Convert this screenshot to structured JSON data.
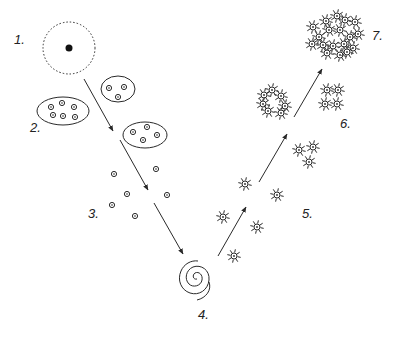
{
  "diagram": {
    "colors": {
      "ink": "#2a2a2a",
      "background": "#ffffff"
    },
    "stages": [
      {
        "label": "1.",
        "x": 14,
        "y": 44,
        "description": "dotted circle with solid nucleus"
      },
      {
        "label": "2.",
        "x": 30,
        "y": 132,
        "description": "clusters of cells in ellipses"
      },
      {
        "label": "3.",
        "x": 88,
        "y": 218,
        "description": "scattered single cells"
      },
      {
        "label": "4.",
        "x": 198,
        "y": 319,
        "description": "spiral"
      },
      {
        "label": "5.",
        "x": 302,
        "y": 218,
        "description": "scattered radiant cells"
      },
      {
        "label": "6.",
        "x": 340,
        "y": 128,
        "description": "small clusters of radiant cells"
      },
      {
        "label": "7.",
        "x": 372,
        "y": 40,
        "description": "large dense cluster of radiant cells"
      }
    ],
    "stage1": {
      "cx": 69,
      "cy": 48,
      "r": 26,
      "nucleus_r": 3.5
    },
    "ellipses": [
      {
        "cx": 63,
        "cy": 111,
        "rx": 26,
        "ry": 14,
        "cells": [
          [
            51,
            107
          ],
          [
            62,
            103
          ],
          [
            74,
            107
          ],
          [
            53,
            115
          ],
          [
            63,
            116
          ],
          [
            75,
            117
          ]
        ]
      },
      {
        "cx": 118,
        "cy": 89,
        "rx": 17,
        "ry": 13,
        "cells": [
          [
            109,
            88
          ],
          [
            124,
            87
          ],
          [
            118,
            97
          ]
        ]
      },
      {
        "cx": 145,
        "cy": 135,
        "rx": 22,
        "ry": 13,
        "cells": [
          [
            133,
            132
          ],
          [
            147,
            127
          ],
          [
            157,
            135
          ],
          [
            143,
            140
          ]
        ]
      }
    ],
    "stage3_cells": [
      [
        114,
        174
      ],
      [
        156,
        169
      ],
      [
        127,
        194
      ],
      [
        112,
        205
      ],
      [
        135,
        216
      ],
      [
        167,
        195
      ]
    ],
    "stage5_stars": [
      [
        223,
        217
      ],
      [
        234,
        256
      ],
      [
        257,
        227
      ],
      [
        245,
        184
      ],
      [
        277,
        195
      ],
      [
        299,
        150
      ],
      [
        313,
        147
      ],
      [
        309,
        162
      ]
    ],
    "stage6_stars": [
      [
        264,
        95
      ],
      [
        272,
        90
      ],
      [
        281,
        96
      ],
      [
        285,
        106
      ],
      [
        263,
        104
      ],
      [
        268,
        111
      ],
      [
        281,
        113
      ],
      [
        327,
        90
      ],
      [
        338,
        90
      ],
      [
        325,
        104
      ],
      [
        337,
        104
      ]
    ],
    "stage7_stars": [
      [
        313,
        27
      ],
      [
        326,
        21
      ],
      [
        337,
        16
      ],
      [
        345,
        20
      ],
      [
        355,
        22
      ],
      [
        358,
        34
      ],
      [
        350,
        37
      ],
      [
        340,
        30
      ],
      [
        329,
        30
      ],
      [
        319,
        37
      ],
      [
        312,
        44
      ],
      [
        323,
        45
      ],
      [
        333,
        46
      ],
      [
        344,
        44
      ],
      [
        353,
        48
      ],
      [
        327,
        53
      ],
      [
        340,
        55
      ],
      [
        347,
        52
      ]
    ],
    "arrows": [
      {
        "x1": 84,
        "y1": 79,
        "x2": 113,
        "y2": 131
      },
      {
        "x1": 120,
        "y1": 140,
        "x2": 148,
        "y2": 190
      },
      {
        "x1": 154,
        "y1": 203,
        "x2": 183,
        "y2": 254
      },
      {
        "x1": 218,
        "y1": 256,
        "x2": 246,
        "y2": 207
      },
      {
        "x1": 259,
        "y1": 182,
        "x2": 287,
        "y2": 134
      },
      {
        "x1": 294,
        "y1": 117,
        "x2": 322,
        "y2": 69
      }
    ]
  }
}
